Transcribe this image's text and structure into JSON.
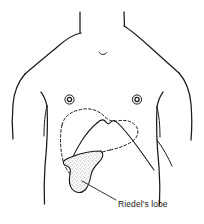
{
  "figure": {
    "kind": "anatomical-surface-diagram",
    "background_color": "#ffffff",
    "ink_color": "#1a1a1a"
  },
  "labels": {
    "riedels_lobe": "Riedel's lobe"
  },
  "markers": {
    "left_nipple_name": "nipple-marker-left",
    "right_nipple_name": "nipple-marker-right",
    "suprasternal_notch_name": "suprasternal-notch-mark"
  },
  "regions": {
    "torso_outline": "body-surface-outline",
    "liver_dashed_outline": "liver-costal-dashed-outline",
    "liver_solid_edge": "liver-inferior-border",
    "riedel_lobe_fill": "stippled"
  }
}
